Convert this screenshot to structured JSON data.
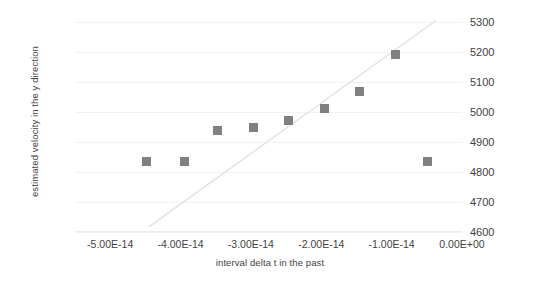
{
  "chart_data": {
    "type": "scatter",
    "title": "",
    "xlabel": "interval delta t in the past",
    "ylabel": "estimated velocity in the y direction",
    "xlim": [
      -5.5e-14,
      0.0
    ],
    "ylim": [
      4600,
      5300
    ],
    "grid": true,
    "legend": "none",
    "marker_color": "#808080",
    "trendline_color": "#e2e2e2",
    "gridline_color": "#f2f2f2",
    "y_ticks": [
      {
        "value": 5300,
        "label": "5300"
      },
      {
        "value": 5200,
        "label": "5200"
      },
      {
        "value": 5100,
        "label": "5100"
      },
      {
        "value": 5000,
        "label": "5000"
      },
      {
        "value": 4900,
        "label": "4900"
      },
      {
        "value": 4800,
        "label": "4800"
      },
      {
        "value": 4700,
        "label": "4700"
      },
      {
        "value": 4600,
        "label": "4600"
      }
    ],
    "x_ticks": [
      {
        "value": -5e-14,
        "label": "-5.00E-14"
      },
      {
        "value": -4e-14,
        "label": "-4.00E-14"
      },
      {
        "value": -3e-14,
        "label": "-3.00E-14"
      },
      {
        "value": -2e-14,
        "label": "-2.00E-14"
      },
      {
        "value": -1e-14,
        "label": "-1.00E-14"
      },
      {
        "value": 0.0,
        "label": "0.00E+00"
      }
    ],
    "series": [
      {
        "name": "estimated velocity",
        "x": [
          -4.48e-14,
          -3.95e-14,
          -3.47e-14,
          -2.96e-14,
          -2.46e-14,
          -1.95e-14,
          -1.45e-14,
          -9.4e-15,
          -4.9e-15
        ],
        "y": [
          4835,
          4835,
          4937,
          4947,
          4971,
          5012,
          5070,
          5192,
          4835
        ]
      }
    ],
    "trendline": {
      "name": "linear trend",
      "x0": -4.45e-14,
      "y0": 4617,
      "x1": -3.7e-15,
      "y1": 5305
    }
  }
}
